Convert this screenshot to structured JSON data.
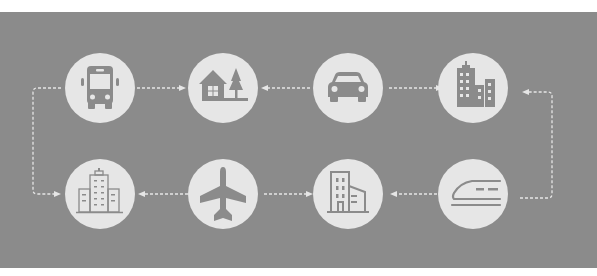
{
  "diagram": {
    "colors": {
      "background": "#8b8b8b",
      "node_fill": "#e6e6e6",
      "icon_fill": "#8b8b8b",
      "connector": "#e6e6e6"
    },
    "nodes": [
      {
        "id": "bus",
        "icon": "bus-icon",
        "row": 1,
        "col": 1
      },
      {
        "id": "house",
        "icon": "house-tree-icon",
        "row": 1,
        "col": 2
      },
      {
        "id": "car",
        "icon": "car-icon",
        "row": 1,
        "col": 3
      },
      {
        "id": "city",
        "icon": "city-skyline-icon",
        "row": 1,
        "col": 4
      },
      {
        "id": "office-building",
        "icon": "office-building-icon",
        "row": 2,
        "col": 1
      },
      {
        "id": "airplane",
        "icon": "airplane-icon",
        "row": 2,
        "col": 2
      },
      {
        "id": "apartment",
        "icon": "apartment-building-icon",
        "row": 2,
        "col": 3
      },
      {
        "id": "bullet-train",
        "icon": "bullet-train-icon",
        "row": 2,
        "col": 4
      }
    ],
    "edges": [
      {
        "from": "bus",
        "to": "house",
        "style": "dashed-arrow"
      },
      {
        "from": "car",
        "to": "house",
        "style": "dashed-arrow"
      },
      {
        "from": "car",
        "to": "city",
        "style": "dashed-arrow"
      },
      {
        "from": "bullet-train",
        "to": "city",
        "style": "dashed-arrow-elbow"
      },
      {
        "from": "bullet-train",
        "to": "apartment",
        "style": "dashed-arrow"
      },
      {
        "from": "airplane",
        "to": "apartment",
        "style": "dashed-arrow"
      },
      {
        "from": "airplane",
        "to": "office-building",
        "style": "dashed-arrow"
      },
      {
        "from": "bus",
        "to": "office-building",
        "style": "dashed-arrow-elbow"
      }
    ]
  }
}
